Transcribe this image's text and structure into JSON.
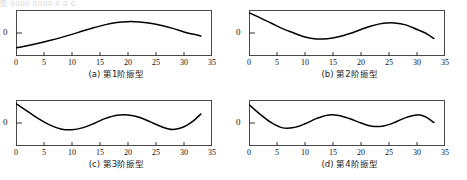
{
  "scan_header": "图 0000 0000 0 0 0",
  "figure": {
    "panels": [
      {
        "key": "mode1",
        "caption": "(a) 第1阶振型",
        "ylabel": "0",
        "xticks": [
          "0",
          "5",
          "10",
          "15",
          "20",
          "25",
          "30",
          "35"
        ]
      },
      {
        "key": "mode2",
        "caption": "(b) 第2阶振型",
        "ylabel": "0",
        "xticks": [
          "0",
          "5",
          "10",
          "15",
          "20",
          "25",
          "30",
          "35"
        ]
      },
      {
        "key": "mode3",
        "caption": "(c) 第3阶振型",
        "ylabel": "0",
        "xticks": [
          "0",
          "5",
          "10",
          "15",
          "20",
          "25",
          "30",
          "35"
        ]
      },
      {
        "key": "mode4",
        "caption": "(d) 第4阶振型",
        "ylabel": "0",
        "xticks": [
          "0",
          "5",
          "10",
          "15",
          "20",
          "25",
          "30",
          "35"
        ]
      }
    ]
  },
  "chart_data": [
    {
      "type": "line",
      "title": "(a) 第1阶振型",
      "xlabel": "",
      "ylabel": "0",
      "xlim": [
        0,
        35
      ],
      "ylim": [
        -0.85,
        0.85
      ],
      "grid": false,
      "legend": "none",
      "xticks": [
        0,
        5,
        10,
        15,
        20,
        25,
        30,
        35
      ],
      "yticks": [
        0
      ],
      "series": [
        {
          "name": "第1阶振型",
          "color": "#000000",
          "x": [
            0,
            2,
            4,
            6,
            8,
            10,
            12,
            14,
            16,
            18,
            20,
            22,
            24,
            26,
            28,
            30,
            31.5,
            33
          ],
          "y": [
            -0.55,
            -0.47,
            -0.38,
            -0.28,
            -0.17,
            -0.05,
            0.08,
            0.2,
            0.31,
            0.39,
            0.42,
            0.41,
            0.36,
            0.28,
            0.17,
            0.04,
            -0.04,
            -0.11
          ]
        }
      ]
    },
    {
      "type": "line",
      "title": "(b) 第2阶振型",
      "xlabel": "",
      "ylabel": "0",
      "xlim": [
        0,
        35
      ],
      "ylim": [
        -0.85,
        0.85
      ],
      "grid": false,
      "legend": "none",
      "xticks": [
        0,
        5,
        10,
        15,
        20,
        25,
        30,
        35
      ],
      "yticks": [
        0
      ],
      "series": [
        {
          "name": "第2阶振型",
          "color": "#000000",
          "x": [
            0,
            2,
            4,
            6,
            8,
            10,
            12,
            14,
            16,
            18,
            20,
            22,
            24,
            26,
            28,
            30,
            31.5,
            33
          ],
          "y": [
            0.75,
            0.56,
            0.36,
            0.16,
            0.0,
            -0.15,
            -0.22,
            -0.21,
            -0.14,
            -0.02,
            0.13,
            0.27,
            0.36,
            0.37,
            0.3,
            0.13,
            0.0,
            -0.2
          ]
        }
      ]
    },
    {
      "type": "line",
      "title": "(c) 第3阶振型",
      "xlabel": "",
      "ylabel": "0",
      "xlim": [
        0,
        35
      ],
      "ylim": [
        -0.85,
        0.85
      ],
      "grid": false,
      "legend": "none",
      "xticks": [
        0,
        5,
        10,
        15,
        20,
        25,
        30,
        35
      ],
      "yticks": [
        0
      ],
      "series": [
        {
          "name": "第3阶振型",
          "color": "#000000",
          "x": [
            0,
            2,
            4,
            6,
            8,
            10,
            12,
            14,
            16,
            18,
            20,
            22,
            24,
            26,
            28,
            30,
            31.5,
            33
          ],
          "y": [
            0.72,
            0.44,
            0.16,
            -0.07,
            -0.22,
            -0.25,
            -0.17,
            -0.01,
            0.17,
            0.29,
            0.3,
            0.21,
            0.04,
            -0.14,
            -0.24,
            -0.14,
            0.05,
            0.33
          ]
        }
      ]
    },
    {
      "type": "line",
      "title": "(d) 第4阶振型",
      "xlabel": "",
      "ylabel": "0",
      "xlim": [
        0,
        35
      ],
      "ylim": [
        -0.85,
        0.85
      ],
      "grid": false,
      "legend": "none",
      "xticks": [
        0,
        5,
        10,
        15,
        20,
        25,
        30,
        35
      ],
      "yticks": [
        0
      ],
      "series": [
        {
          "name": "第4阶振型",
          "color": "#000000",
          "x": [
            0,
            2,
            4,
            6,
            8,
            10,
            12,
            14,
            16,
            18,
            20,
            22,
            24,
            26,
            28,
            30,
            31.5,
            33
          ],
          "y": [
            0.68,
            0.32,
            0.01,
            -0.18,
            -0.17,
            -0.03,
            0.16,
            0.29,
            0.28,
            0.16,
            0.0,
            -0.12,
            -0.11,
            0.02,
            0.2,
            0.3,
            0.23,
            0.02
          ]
        }
      ]
    }
  ]
}
